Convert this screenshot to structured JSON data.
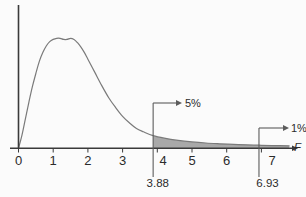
{
  "chart_data": {
    "type": "area",
    "title": "",
    "subtitle": "",
    "xlabel": "F",
    "ylabel": "",
    "xlim": [
      0,
      7.8
    ],
    "ylim": [
      0,
      1.05
    ],
    "grid": false,
    "legend": null,
    "curve_name": "F distribution density",
    "peak_x": 1.5,
    "x": [
      0,
      0.1,
      0.2,
      0.3,
      0.4,
      0.5,
      0.6,
      0.7,
      0.8,
      0.9,
      1.0,
      1.1,
      1.2,
      1.3,
      1.4,
      1.5,
      1.6,
      1.7,
      1.8,
      1.9,
      2.0,
      2.2,
      2.4,
      2.6,
      2.8,
      3.0,
      3.2,
      3.4,
      3.6,
      3.88,
      4.2,
      4.6,
      5.0,
      5.4,
      5.8,
      6.2,
      6.6,
      6.93,
      7.3,
      7.8
    ],
    "y": [
      0.0,
      0.12,
      0.27,
      0.42,
      0.56,
      0.68,
      0.79,
      0.87,
      0.93,
      0.97,
      0.99,
      1.0,
      1.0,
      0.99,
      0.99,
      1.0,
      0.99,
      0.96,
      0.92,
      0.87,
      0.81,
      0.69,
      0.57,
      0.46,
      0.37,
      0.29,
      0.23,
      0.18,
      0.15,
      0.115,
      0.092,
      0.072,
      0.058,
      0.048,
      0.041,
      0.035,
      0.031,
      0.028,
      0.025,
      0.022
    ],
    "x_ticks": [
      0,
      1,
      2,
      3,
      4,
      5,
      6,
      7
    ],
    "x_tick_labels": [
      "0",
      "1",
      "2",
      "3",
      "4",
      "5",
      "6",
      "7"
    ],
    "shaded_region": {
      "from": 3.88,
      "to": 7.8,
      "fill_color": "#a9a9a9",
      "label": "upper tail area"
    },
    "critical_values": [
      {
        "value": 3.88,
        "label": "3.88",
        "tail": "5%"
      },
      {
        "value": 6.93,
        "label": "6.93",
        "tail": "1%"
      }
    ],
    "annotations": [
      {
        "name": "five-percent",
        "text": "5%",
        "points_to": 3.88
      },
      {
        "name": "one-percent",
        "text": "1%",
        "points_to": 6.93
      }
    ],
    "colors": {
      "axis": "#3a3a3a",
      "curve": "#6b6b6b",
      "fill": "#a9a9a9",
      "text": "#2b2b2b",
      "background": "#fbfbfb"
    }
  },
  "axis": {
    "x_name": "F",
    "tick_0": "0",
    "tick_1": "1",
    "tick_2": "2",
    "tick_3": "3",
    "tick_4": "4",
    "tick_5": "5",
    "tick_6": "6",
    "tick_7": "7"
  },
  "labels": {
    "crit_5pct": "3.88",
    "crit_1pct": "6.93",
    "tail_5pct": "5%",
    "tail_1pct": "1%"
  }
}
